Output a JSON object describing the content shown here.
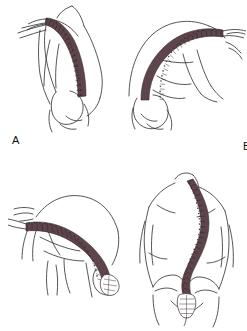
{
  "figure": {
    "background_color": "#ffffff",
    "line_color": "#2b2b2b",
    "spine_color": "#5d454b",
    "spine_color_light": "#8d747a",
    "panel_count": 4
  },
  "panels": [
    {
      "id": "A",
      "label": "A",
      "caption": "Standing lateral view with forward trunk inclination and thoracic kyphosis",
      "view": "lateral",
      "spine_regions": [
        "cervical",
        "thoracic",
        "lumbar",
        "sacrum"
      ],
      "pelvis_visible": true
    },
    {
      "id": "B",
      "label": "B",
      "caption": "Forward bending lateral view showing rounded thoracolumbar curve",
      "view": "lateral-forward-bend",
      "spine_regions": [
        "cervical",
        "thoracic",
        "lumbar",
        "sacrum"
      ],
      "pelvis_visible": true
    },
    {
      "id": "C",
      "label": "C",
      "caption": "Full forward flexion lateral view, spine nearly horizontal",
      "view": "lateral-full-flexion",
      "spine_regions": [
        "cervical",
        "thoracic",
        "lumbar",
        "sacrum"
      ],
      "pelvis_visible": true
    },
    {
      "id": "D",
      "label": "D",
      "caption": "Posterior view showing lateral S-shaped scoliotic curve with pelvis and sacrum",
      "view": "posterior",
      "spine_regions": [
        "cervical",
        "thoracic",
        "lumbar",
        "sacrum"
      ],
      "pelvis_visible": true
    }
  ],
  "icons": {
    "spine": "vertebral-column-icon",
    "pelvis": "pelvis-icon",
    "torso": "torso-outline-icon"
  }
}
